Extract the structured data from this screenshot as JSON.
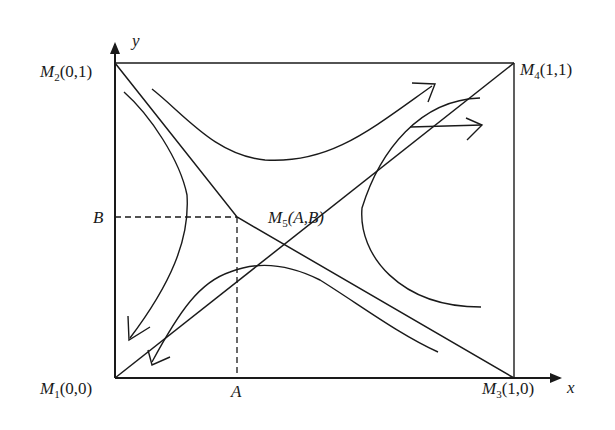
{
  "diagram": {
    "type": "phase-diagram",
    "axes": {
      "x_label": "x",
      "y_label": "y"
    },
    "points": [
      {
        "id": "M1",
        "name": "M",
        "sub": "1",
        "coords": "(0,0)"
      },
      {
        "id": "M2",
        "name": "M",
        "sub": "2",
        "coords": "(0,1)"
      },
      {
        "id": "M3",
        "name": "M",
        "sub": "3",
        "coords": "(1,0)"
      },
      {
        "id": "M4",
        "name": "M",
        "sub": "4",
        "coords": "(1,1)"
      },
      {
        "id": "M5",
        "name": "M",
        "sub": "5",
        "coords": "(A,B)"
      }
    ],
    "tick_labels": {
      "x": "A",
      "y": "B"
    },
    "colors": {
      "stroke": "#1a1a1a",
      "background": "#ffffff"
    }
  }
}
